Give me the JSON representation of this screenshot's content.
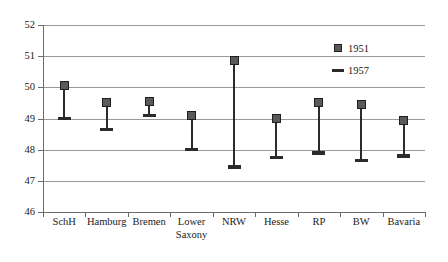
{
  "chart_data": {
    "type": "scatter",
    "title": "",
    "subtitle": "",
    "xlabel": "",
    "ylabel": "",
    "categories": [
      "SchH",
      "Hamburg",
      "Bremen",
      "Lower Saxony",
      "NRW",
      "Hesse",
      "RP",
      "BW",
      "Bavaria"
    ],
    "category_lines": [
      [
        "SchH"
      ],
      [
        "Hamburg"
      ],
      [
        "Bremen"
      ],
      [
        "Lower",
        "Saxony"
      ],
      [
        "NRW"
      ],
      [
        "Hesse"
      ],
      [
        "RP"
      ],
      [
        "BW"
      ],
      [
        "Bavaria"
      ]
    ],
    "series": [
      {
        "name": "1951",
        "marker": "square",
        "color": "#5a5a5a",
        "values": [
          50.05,
          49.5,
          49.55,
          49.1,
          50.85,
          49.0,
          49.5,
          49.45,
          48.95
        ]
      },
      {
        "name": "1957",
        "marker": "dash",
        "color": "#2b2b2b",
        "values": [
          49.0,
          48.65,
          49.1,
          48.0,
          47.45,
          47.75,
          47.9,
          47.65,
          47.8
        ]
      }
    ],
    "ylim": [
      46,
      52
    ],
    "yticks": [
      52,
      51,
      50,
      49,
      48,
      47,
      46
    ],
    "ytick_labels": [
      "52",
      "51",
      "50",
      "49",
      "48",
      "47",
      "46"
    ],
    "grid": true,
    "grid_axis": "y",
    "legend": {
      "position": "inside-top-right",
      "entries": [
        {
          "label": "1951",
          "marker": "square"
        },
        {
          "label": "1957",
          "marker": "dash"
        }
      ]
    }
  }
}
